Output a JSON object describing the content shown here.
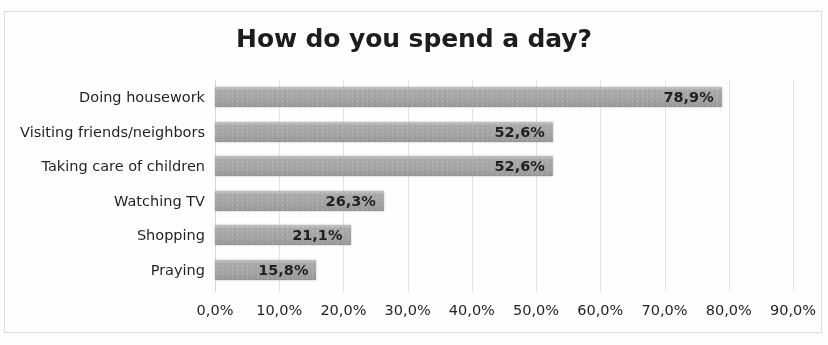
{
  "chart_data": {
    "type": "bar",
    "orientation": "horizontal",
    "title": "How do you spend a day?",
    "xlabel": "",
    "ylabel": "",
    "categories": [
      "Doing housework",
      "Visiting friends/neighbors",
      "Taking care of children",
      "Watching TV",
      "Shopping",
      "Praying"
    ],
    "values": [
      78.9,
      52.6,
      52.6,
      26.3,
      21.1,
      15.8
    ],
    "value_labels": [
      "78,9%",
      "52,6%",
      "52,6%",
      "26,3%",
      "21,1%",
      "15,8%"
    ],
    "xlim": [
      0,
      90
    ],
    "xticks": [
      0,
      10,
      20,
      30,
      40,
      50,
      60,
      70,
      80,
      90
    ],
    "xtick_labels": [
      "0,0%",
      "10,0%",
      "20,0%",
      "30,0%",
      "40,0%",
      "50,0%",
      "60,0%",
      "70,0%",
      "80,0%",
      "90,0%"
    ],
    "grid": true,
    "grid_axis": "x",
    "legend": false,
    "bar_color": "#a7a7a7",
    "text_color": "#1f1f1f",
    "gridline_color": "#e3e3e3",
    "frame_color": "#dcdcdc",
    "data_labels_inside": true
  }
}
